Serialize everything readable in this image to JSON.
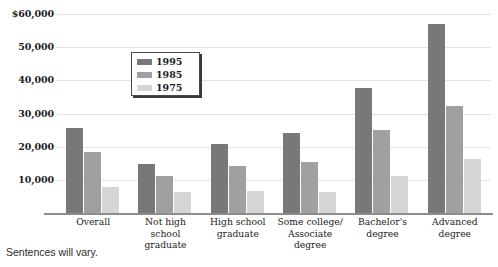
{
  "caption": "Sentences will vary.",
  "legend": {
    "position": "inside-upper-left",
    "entries": [
      {
        "label": "1995",
        "color": "#787878"
      },
      {
        "label": "1985",
        "color": "#a0a0a0"
      },
      {
        "label": "1975",
        "color": "#d6d6d6"
      }
    ]
  },
  "y_axis": {
    "ticks": [
      "$60,000",
      "50,000",
      "40,000",
      "30,000",
      "20,000",
      "10,000"
    ],
    "tick_values": [
      60000,
      50000,
      40000,
      30000,
      20000,
      10000
    ]
  },
  "x_axis": {
    "labels": [
      "Overall",
      "Not high\nschool\ngraduate",
      "High school\ngraduate",
      "Some college/\nAssociate\ndegree",
      "Bachelor's\ndegree",
      "Advanced\ndegree"
    ]
  },
  "chart_data": {
    "type": "bar",
    "title": "",
    "subtitle": "",
    "xlabel": "",
    "ylabel": "",
    "ylim": [
      0,
      60000
    ],
    "grid": true,
    "legend_position": "inside-upper-left",
    "categories": [
      "Overall",
      "Not high school graduate",
      "High school graduate",
      "Some college/Associate degree",
      "Bachelor's degree",
      "Advanced degree"
    ],
    "series": [
      {
        "name": "1995",
        "color": "#787878",
        "values": [
          25600,
          14800,
          20800,
          24100,
          37700,
          57000
        ]
      },
      {
        "name": "1985",
        "color": "#a0a0a0",
        "values": [
          18400,
          11200,
          14200,
          15400,
          25000,
          32300
        ]
      },
      {
        "name": "1975",
        "color": "#d6d6d6",
        "values": [
          7800,
          6400,
          6600,
          6400,
          11200,
          16300
        ]
      }
    ]
  }
}
